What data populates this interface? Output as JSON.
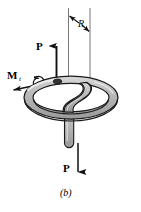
{
  "figure": {
    "caption": "(b)",
    "colors": {
      "outline": "#1a1a1a",
      "tube_fill": "#b8b8b8",
      "tube_highlight": "#e0e0e0",
      "centerline": "#555555",
      "background": "#ffffff"
    }
  },
  "labels": {
    "force_top": "P",
    "force_bottom": "P",
    "moment": "M",
    "moment_subscript": "t",
    "radius": "R"
  },
  "annotations": {
    "radius_dimension": "R",
    "top_force_direction": "up",
    "bottom_force_direction": "down",
    "moment_direction": "down-left",
    "rotation_symbol": "curved-arrow"
  }
}
